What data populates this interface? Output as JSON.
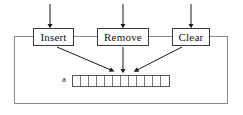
{
  "diagram": {
    "type": "block-diagram",
    "title": "",
    "background_color": "#ffffff",
    "line_color": "#3a3a3a",
    "text_color": "#141414",
    "operations": [
      {
        "label": "Insert",
        "x": 33,
        "y": 28,
        "width": 41,
        "height": 18
      },
      {
        "label": "Remove",
        "x": 97,
        "y": 28,
        "width": 52,
        "height": 18
      },
      {
        "label": "Clear",
        "x": 172,
        "y": 28,
        "width": 38,
        "height": 18
      }
    ],
    "array": {
      "label": "a",
      "label_x": 62,
      "label_y": 75,
      "x": 72,
      "y": 75,
      "cell_count": 12,
      "cell_width": 8,
      "cell_height": 10,
      "cells": [
        "",
        "",
        "",
        "",
        "",
        "",
        "",
        "",
        "",
        "",
        "",
        ""
      ]
    },
    "enclosure": {
      "x": 14,
      "y": 36,
      "width": 214,
      "height": 68
    },
    "input_arrows": [
      {
        "target": "Insert",
        "x": 50,
        "y_from": 4,
        "y_to": 27
      },
      {
        "target": "Remove",
        "x": 123,
        "y_from": 4,
        "y_to": 27
      },
      {
        "target": "Clear",
        "x": 191,
        "y_from": 4,
        "y_to": 27
      }
    ],
    "access_arrows": [
      {
        "from": "Insert",
        "label": "insert-to-array",
        "x1": 58,
        "y1": 47,
        "x2": 113,
        "y2": 72
      },
      {
        "from": "Remove",
        "label": "remove-to-array",
        "x1": 123,
        "y1": 47,
        "x2": 123,
        "y2": 72
      },
      {
        "from": "Clear",
        "label": "clear-to-array",
        "x1": 180,
        "y1": 47,
        "x2": 139,
        "y2": 72
      }
    ]
  }
}
